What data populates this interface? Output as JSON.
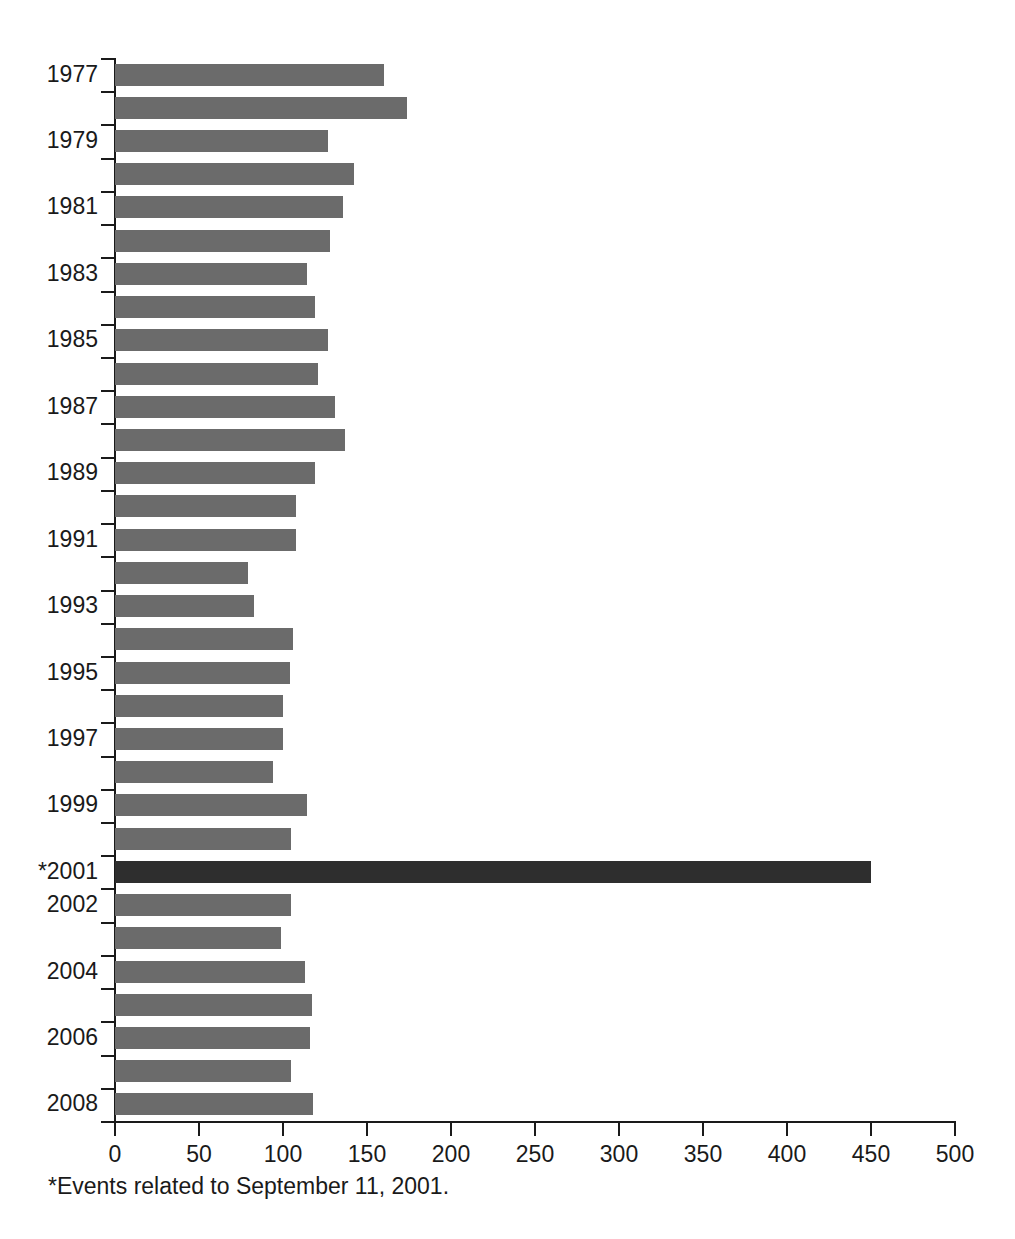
{
  "footnote": "*Events related to September 11, 2001.",
  "colors": {
    "bar": "#6b6b6b",
    "bar_highlight": "#2e2e2e",
    "axis": "#1a1a1a",
    "background": "#ffffff"
  },
  "chart_data": {
    "type": "bar",
    "orientation": "horizontal",
    "title": "",
    "subtitle": "",
    "xlabel": "",
    "ylabel": "",
    "xlim": [
      0,
      500
    ],
    "ylim": null,
    "grid": false,
    "legend": null,
    "xticks": [
      0,
      50,
      100,
      150,
      200,
      250,
      300,
      350,
      400,
      450,
      500
    ],
    "xtick_labels": [
      "0",
      "50",
      "100",
      "150",
      "200",
      "250",
      "300",
      "350",
      "400",
      "450",
      "500"
    ],
    "categories": [
      "1977",
      "1978",
      "1979",
      "1980",
      "1981",
      "1982",
      "1983",
      "1984",
      "1985",
      "1986",
      "1987",
      "1988",
      "1989",
      "1990",
      "1991",
      "1992",
      "1993",
      "1994",
      "1995",
      "1996",
      "1997",
      "1998",
      "1999",
      "2000",
      "*2001",
      "2002",
      "2003",
      "2004",
      "2005",
      "2006",
      "2007",
      "2008"
    ],
    "visible_category_labels": [
      "1977",
      "1979",
      "1981",
      "1983",
      "1985",
      "1987",
      "1989",
      "1991",
      "1993",
      "1995",
      "1997",
      "1999",
      "*2001",
      "2002",
      "2004",
      "2006",
      "2008"
    ],
    "values": [
      160,
      174,
      127,
      142,
      136,
      128,
      114,
      119,
      127,
      121,
      131,
      137,
      119,
      108,
      108,
      79,
      83,
      106,
      104,
      100,
      100,
      94,
      114,
      105,
      450,
      105,
      99,
      113,
      117,
      116,
      105,
      118
    ],
    "highlight_category": "*2001",
    "highlight_value": 450,
    "annotations": [
      "*Events related to September 11, 2001."
    ]
  }
}
